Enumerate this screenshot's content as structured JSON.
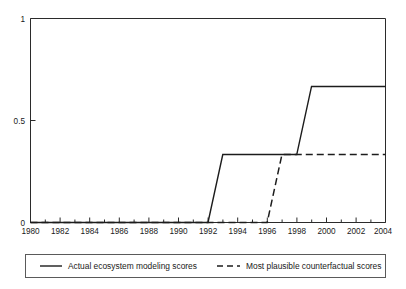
{
  "chart_data": {
    "type": "line",
    "title": "",
    "subtitle": "",
    "xlabel": "",
    "ylabel": "",
    "xlim": [
      1980,
      2004
    ],
    "ylim": [
      0,
      1
    ],
    "grid": false,
    "legend_position": "below-plot",
    "x_tick_labels": [
      "1980",
      "1982",
      "1984",
      "1986",
      "1988",
      "1990",
      "1992",
      "1994",
      "1996",
      "1998",
      "2000",
      "2002",
      "2004"
    ],
    "x_tick_values": [
      1980,
      1982,
      1984,
      1986,
      1988,
      1990,
      1992,
      1994,
      1996,
      1998,
      2000,
      2002,
      2004
    ],
    "x_minor_tick_values": [
      1981,
      1983,
      1985,
      1987,
      1989,
      1991,
      1993,
      1995,
      1997,
      1999,
      2001,
      2003
    ],
    "y_tick_labels": [
      "0",
      "0.5",
      "1"
    ],
    "y_tick_values": [
      0,
      0.5,
      1
    ],
    "x": [
      1980,
      1981,
      1982,
      1983,
      1984,
      1985,
      1986,
      1987,
      1988,
      1989,
      1990,
      1991,
      1992,
      1993,
      1994,
      1995,
      1996,
      1997,
      1998,
      1999,
      2000,
      2001,
      2002,
      2003,
      2004
    ],
    "series": [
      {
        "name": "Actual ecosystem modeling scores",
        "style": "solid",
        "color": "#1c1c1c",
        "values": [
          0,
          0,
          0,
          0,
          0,
          0,
          0,
          0,
          0,
          0,
          0,
          0,
          0,
          0.333,
          0.333,
          0.333,
          0.333,
          0.333,
          0.333,
          0.667,
          0.667,
          0.667,
          0.667,
          0.667,
          0.667
        ]
      },
      {
        "name": "Most plausible counterfactual scores",
        "style": "dashed",
        "color": "#1c1c1c",
        "values": [
          0,
          0,
          0,
          0,
          0,
          0,
          0,
          0,
          0,
          0,
          0,
          0,
          0,
          0,
          0,
          0,
          0,
          0.333,
          0.333,
          0.333,
          0.333,
          0.333,
          0.333,
          0.333,
          0.333
        ]
      }
    ],
    "annotations": []
  },
  "legend": {
    "items": [
      {
        "label": "Actual ecosystem modeling scores",
        "style": "solid"
      },
      {
        "label": "Most plausible counterfactual scores",
        "style": "dashed"
      }
    ]
  }
}
